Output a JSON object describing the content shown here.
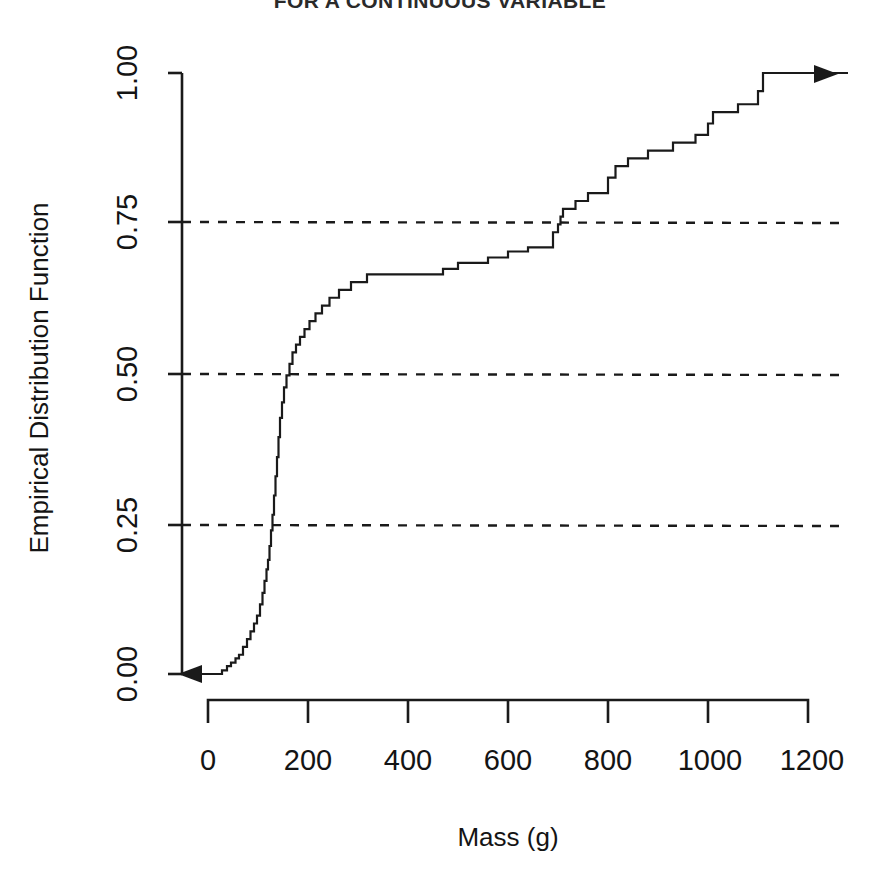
{
  "chart_data": {
    "type": "line",
    "subtype": "empirical-cdf-step",
    "title": "FOR A CONTINUOUS VARIABLE",
    "xlabel": "Mass (g)",
    "ylabel": "Empirical Distribution Function",
    "xlim": [
      -60,
      1280
    ],
    "ylim": [
      0.0,
      1.0
    ],
    "xticks": [
      0,
      200,
      400,
      600,
      800,
      1000,
      1200
    ],
    "xtick_labels": [
      "0",
      "200",
      "400",
      "600",
      "800",
      "1000",
      "1200"
    ],
    "yticks": [
      0.0,
      0.25,
      0.5,
      0.75,
      1.0
    ],
    "ytick_labels": [
      "0.00",
      "0.25",
      "0.50",
      "0.75",
      "1.00"
    ],
    "grid": "horizontal-dashed",
    "gridlines_y": [
      0.25,
      0.5,
      0.75
    ],
    "legend": "none",
    "line_color": "#1a1a1a",
    "left_arrow": true,
    "right_arrow": true,
    "annotations": [
      "step function starts at 0.00 extending left with arrow",
      "step function reaches 1.00 near x = 1100 extending right with arrow"
    ],
    "step_points": [
      [
        -60,
        0.0
      ],
      [
        20,
        0.0
      ],
      [
        28,
        0.006
      ],
      [
        38,
        0.013
      ],
      [
        46,
        0.019
      ],
      [
        55,
        0.026
      ],
      [
        62,
        0.032
      ],
      [
        70,
        0.045
      ],
      [
        78,
        0.058
      ],
      [
        85,
        0.071
      ],
      [
        92,
        0.084
      ],
      [
        98,
        0.097
      ],
      [
        104,
        0.116
      ],
      [
        109,
        0.135
      ],
      [
        113,
        0.155
      ],
      [
        117,
        0.174
      ],
      [
        120,
        0.19
      ],
      [
        123,
        0.213
      ],
      [
        126,
        0.239
      ],
      [
        129,
        0.265
      ],
      [
        132,
        0.297
      ],
      [
        135,
        0.329
      ],
      [
        138,
        0.361
      ],
      [
        141,
        0.394
      ],
      [
        144,
        0.426
      ],
      [
        148,
        0.452
      ],
      [
        152,
        0.477
      ],
      [
        157,
        0.497
      ],
      [
        163,
        0.516
      ],
      [
        169,
        0.535
      ],
      [
        176,
        0.548
      ],
      [
        184,
        0.561
      ],
      [
        193,
        0.574
      ],
      [
        203,
        0.587
      ],
      [
        215,
        0.6
      ],
      [
        228,
        0.613
      ],
      [
        243,
        0.626
      ],
      [
        262,
        0.639
      ],
      [
        286,
        0.652
      ],
      [
        318,
        0.665
      ],
      [
        470,
        0.674
      ],
      [
        500,
        0.684
      ],
      [
        560,
        0.693
      ],
      [
        600,
        0.703
      ],
      [
        640,
        0.71
      ],
      [
        690,
        0.735
      ],
      [
        700,
        0.748
      ],
      [
        705,
        0.761
      ],
      [
        710,
        0.774
      ],
      [
        735,
        0.787
      ],
      [
        760,
        0.8
      ],
      [
        800,
        0.826
      ],
      [
        815,
        0.845
      ],
      [
        840,
        0.858
      ],
      [
        880,
        0.871
      ],
      [
        930,
        0.884
      ],
      [
        975,
        0.897
      ],
      [
        1000,
        0.916
      ],
      [
        1010,
        0.935
      ],
      [
        1060,
        0.948
      ],
      [
        1100,
        0.97
      ],
      [
        1110,
        1.0
      ],
      [
        1280,
        1.0
      ]
    ]
  },
  "axes": {
    "x_title": "Mass (g)",
    "y_title": "Empirical Distribution Function",
    "x_tick_labels": [
      "0",
      "200",
      "400",
      "600",
      "800",
      "1000",
      "1200"
    ],
    "y_tick_labels": [
      "0.00",
      "0.25",
      "0.50",
      "0.75",
      "1.00"
    ]
  },
  "header": {
    "title": "FOR A CONTINUOUS VARIABLE"
  }
}
